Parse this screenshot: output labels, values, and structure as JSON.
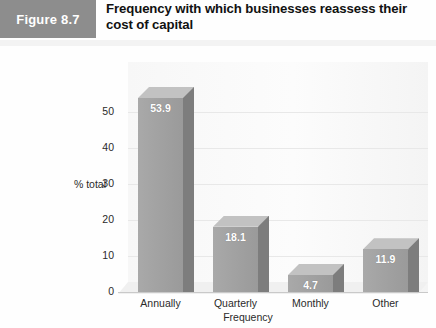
{
  "figure": {
    "tag": "Figure 8.7",
    "title": "Frequency with which businesses reassess their cost of capital"
  },
  "colors": {
    "tag_background": "#8d8d8d",
    "bar_front": "#a2a2a2",
    "bar_side": "#7d7d7d",
    "bar_top": "#c2c2c2",
    "plot_background": "#fbfbfb",
    "gridline": "#e8e8e8",
    "label_text": "#ffffff"
  },
  "chart_data": {
    "type": "bar",
    "title": "Frequency with which businesses reassess their cost of capital",
    "categories": [
      "Annually",
      "Quarterly",
      "Monthly",
      "Other"
    ],
    "values": [
      53.9,
      18.1,
      4.7,
      11.9
    ],
    "data_labels": [
      "53.9",
      "18.1",
      "4.7",
      "11.9"
    ],
    "xlabel": "Frequency",
    "ylabel": "% total",
    "ylim": [
      0,
      60
    ],
    "yticks": [
      0,
      10,
      20,
      30,
      40,
      50
    ],
    "ytick_labels": [
      "0",
      "10",
      "20",
      "30",
      "40",
      "50"
    ],
    "grid": true,
    "legend": false,
    "style": "3d-column"
  }
}
